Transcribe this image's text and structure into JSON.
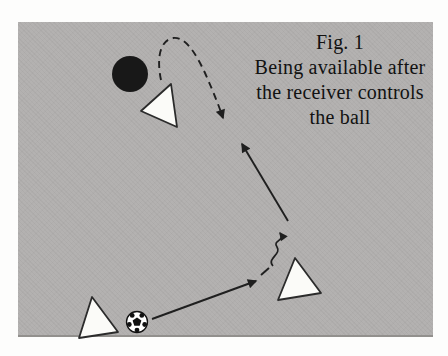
{
  "caption": {
    "lines": [
      "Fig. 1",
      "Being available after",
      "the receiver controls",
      "the ball"
    ]
  },
  "colors": {
    "page_bg": "#fdfdfc",
    "field": "#b2b0af",
    "field_bottom_edge": "#92908d",
    "line": "#1f1f1f",
    "triangle_fill": "#fbfbf8",
    "triangle_stroke": "#2b2b2b",
    "opponent_fill": "#181818",
    "text": "#121212",
    "ball_white": "#ffffff",
    "ball_black": "#111111"
  },
  "diagram": {
    "field": {
      "x": 18,
      "y": 22,
      "width": 415,
      "height": 313
    },
    "opponent": {
      "name": "opponent-marker",
      "cx": 130,
      "cy": 74,
      "r": 18
    },
    "players": [
      {
        "name": "supporting-player-marker",
        "points": [
          [
            171,
            84
          ],
          [
            141,
            111
          ],
          [
            177,
            127
          ]
        ]
      },
      {
        "name": "receiver-player-marker",
        "points": [
          [
            295,
            258
          ],
          [
            278,
            300
          ],
          [
            321,
            293
          ]
        ]
      },
      {
        "name": "passer-player-marker",
        "points": [
          [
            92,
            297
          ],
          [
            79,
            338
          ],
          [
            118,
            332
          ]
        ]
      }
    ],
    "ball": {
      "name": "soccer-ball",
      "cx": 137,
      "cy": 322,
      "r": 10.5
    },
    "arrows": [
      {
        "name": "pass-arrow",
        "kind": "solid",
        "path": "M 152 319 L 256 281",
        "arrow": true
      },
      {
        "name": "control-dash",
        "kind": "solid",
        "path": "M 261 275 L 269 268",
        "arrow": false
      },
      {
        "name": "dribble-squiggle-arrow",
        "kind": "squiggle",
        "path": "M 273 266 C 266 259 282 254 277 247 C 272 240 286 241 280 233",
        "arrow": true
      },
      {
        "name": "forward-pass-arrow",
        "kind": "solid",
        "path": "M 288 221 L 242 144",
        "arrow": true
      },
      {
        "name": "curved-run-arrow",
        "kind": "dashed",
        "path": "M 161 80 C 156 56 161 40 173 38 C 186 36 197 56 205 73 C 213 91 219 106 223 118",
        "arrow": true
      }
    ]
  }
}
